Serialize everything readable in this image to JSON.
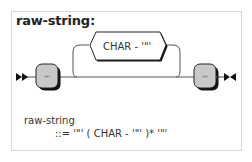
{
  "rule": {
    "title": "raw-string:",
    "name": "raw-string"
  },
  "diagram": {
    "start_marker": "double-arrow-start",
    "end_marker": "double-arrow-end",
    "terminals": [
      {
        "label": "'\"'"
      },
      {
        "label": "'\"'"
      }
    ],
    "loop_item": {
      "label": "CHAR - '\"'"
    },
    "colors": {
      "terminal_fill": "#c8c8c8",
      "terminal_stroke": "#000000",
      "nonterminal_fill": "#ffffff",
      "line": "#333333"
    }
  },
  "ebnf": {
    "name": "raw-string",
    "definition": "::= '\"' ( CHAR - '\"' )* '\"'"
  }
}
